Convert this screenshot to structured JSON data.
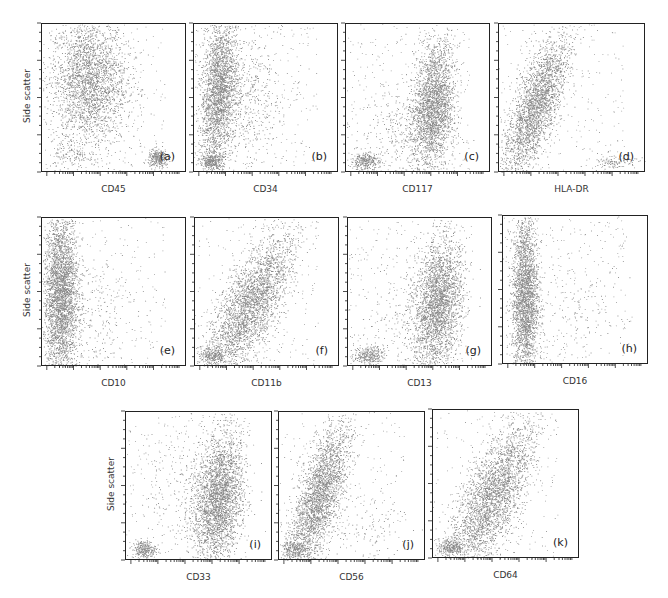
{
  "chart_data": {
    "type": "scatter",
    "ylabel": "Side scatter",
    "panels": [
      {
        "id": "a",
        "tag": "(a)",
        "xlabel": "CD45",
        "box": [
          41,
          23,
          145,
          149
        ],
        "row": 1,
        "clusters": [
          {
            "cx": 0.32,
            "cy": 0.62,
            "sx": 0.13,
            "sy": 0.22,
            "n": 2600,
            "rot": 0
          },
          {
            "cx": 0.8,
            "cy": 0.1,
            "sx": 0.035,
            "sy": 0.03,
            "n": 300,
            "rot": 0
          },
          {
            "cx": 0.2,
            "cy": 0.12,
            "sx": 0.08,
            "sy": 0.05,
            "n": 120,
            "rot": 0
          }
        ]
      },
      {
        "id": "b",
        "tag": "(b)",
        "xlabel": "CD34",
        "box": [
          193,
          23,
          145,
          149
        ],
        "row": 1,
        "clusters": [
          {
            "cx": 0.17,
            "cy": 0.55,
            "sx": 0.06,
            "sy": 0.25,
            "n": 2400,
            "rot": -0.08
          },
          {
            "cx": 0.12,
            "cy": 0.08,
            "sx": 0.04,
            "sy": 0.03,
            "n": 300,
            "rot": 0
          },
          {
            "cx": 0.35,
            "cy": 0.5,
            "sx": 0.12,
            "sy": 0.2,
            "n": 500,
            "rot": 0
          }
        ]
      },
      {
        "id": "c",
        "tag": "(c)",
        "xlabel": "CD117",
        "box": [
          345,
          23,
          145,
          149
        ],
        "row": 1,
        "clusters": [
          {
            "cx": 0.6,
            "cy": 0.45,
            "sx": 0.07,
            "sy": 0.22,
            "n": 2500,
            "rot": -0.1
          },
          {
            "cx": 0.13,
            "cy": 0.08,
            "sx": 0.05,
            "sy": 0.03,
            "n": 300,
            "rot": 0
          },
          {
            "cx": 0.4,
            "cy": 0.3,
            "sx": 0.15,
            "sy": 0.15,
            "n": 300,
            "rot": 0
          }
        ]
      },
      {
        "id": "d",
        "tag": "(d)",
        "xlabel": "HLA-DR",
        "box": [
          498,
          23,
          147,
          149
        ],
        "row": 1,
        "clusters": [
          {
            "cx": 0.25,
            "cy": 0.45,
            "sx": 0.07,
            "sy": 0.25,
            "n": 2500,
            "rot": -0.35
          },
          {
            "cx": 0.78,
            "cy": 0.08,
            "sx": 0.08,
            "sy": 0.025,
            "n": 120,
            "rot": 0
          }
        ]
      },
      {
        "id": "e",
        "tag": "(e)",
        "xlabel": "CD10",
        "box": [
          41,
          217,
          145,
          149
        ],
        "row": 2,
        "clusters": [
          {
            "cx": 0.13,
            "cy": 0.48,
            "sx": 0.06,
            "sy": 0.28,
            "n": 3200,
            "rot": 0
          },
          {
            "cx": 0.35,
            "cy": 0.4,
            "sx": 0.15,
            "sy": 0.2,
            "n": 200,
            "rot": 0
          }
        ]
      },
      {
        "id": "f",
        "tag": "(f)",
        "xlabel": "CD11b",
        "box": [
          194,
          217,
          145,
          149
        ],
        "row": 2,
        "clusters": [
          {
            "cx": 0.38,
            "cy": 0.42,
            "sx": 0.09,
            "sy": 0.26,
            "n": 2700,
            "rot": -0.5
          },
          {
            "cx": 0.12,
            "cy": 0.08,
            "sx": 0.05,
            "sy": 0.03,
            "n": 250,
            "rot": 0
          }
        ]
      },
      {
        "id": "g",
        "tag": "(g)",
        "xlabel": "CD13",
        "box": [
          347,
          217,
          145,
          149
        ],
        "row": 2,
        "clusters": [
          {
            "cx": 0.62,
            "cy": 0.42,
            "sx": 0.08,
            "sy": 0.22,
            "n": 2600,
            "rot": -0.1
          },
          {
            "cx": 0.14,
            "cy": 0.08,
            "sx": 0.05,
            "sy": 0.03,
            "n": 280,
            "rot": 0
          },
          {
            "cx": 0.45,
            "cy": 0.35,
            "sx": 0.15,
            "sy": 0.2,
            "n": 250,
            "rot": 0
          }
        ]
      },
      {
        "id": "h",
        "tag": "(h)",
        "xlabel": "CD16",
        "box": [
          502,
          215,
          146,
          149
        ],
        "row": 2,
        "clusters": [
          {
            "cx": 0.15,
            "cy": 0.45,
            "sx": 0.045,
            "sy": 0.28,
            "n": 2600,
            "rot": 0
          },
          {
            "cx": 0.5,
            "cy": 0.35,
            "sx": 0.18,
            "sy": 0.2,
            "n": 150,
            "rot": 0
          }
        ]
      },
      {
        "id": "i",
        "tag": "(i)",
        "xlabel": "CD33",
        "box": [
          125,
          411,
          147,
          149
        ],
        "row": 3,
        "clusters": [
          {
            "cx": 0.63,
            "cy": 0.42,
            "sx": 0.08,
            "sy": 0.22,
            "n": 2700,
            "rot": -0.1
          },
          {
            "cx": 0.12,
            "cy": 0.08,
            "sx": 0.04,
            "sy": 0.03,
            "n": 280,
            "rot": 0
          },
          {
            "cx": 0.45,
            "cy": 0.4,
            "sx": 0.15,
            "sy": 0.2,
            "n": 300,
            "rot": 0
          }
        ]
      },
      {
        "id": "j",
        "tag": "(j)",
        "xlabel": "CD56",
        "box": [
          278,
          411,
          147,
          149
        ],
        "row": 3,
        "clusters": [
          {
            "cx": 0.27,
            "cy": 0.42,
            "sx": 0.07,
            "sy": 0.26,
            "n": 2600,
            "rot": -0.3
          },
          {
            "cx": 0.1,
            "cy": 0.08,
            "sx": 0.05,
            "sy": 0.03,
            "n": 250,
            "rot": 0
          },
          {
            "cx": 0.6,
            "cy": 0.25,
            "sx": 0.15,
            "sy": 0.15,
            "n": 120,
            "rot": 0
          }
        ]
      },
      {
        "id": "k",
        "tag": "(k)",
        "xlabel": "CD64",
        "box": [
          432,
          409,
          147,
          149
        ],
        "row": 3,
        "clusters": [
          {
            "cx": 0.4,
            "cy": 0.42,
            "sx": 0.09,
            "sy": 0.27,
            "n": 2700,
            "rot": -0.45
          },
          {
            "cx": 0.12,
            "cy": 0.08,
            "sx": 0.05,
            "sy": 0.03,
            "n": 280,
            "rot": 0
          }
        ]
      }
    ],
    "ylabels": [
      {
        "text": "Side scatter",
        "x": 27,
        "y": 97
      },
      {
        "text": "Side scatter",
        "x": 27,
        "y": 291
      },
      {
        "text": "Side scatter",
        "x": 111,
        "y": 485
      }
    ],
    "x_scale": "log",
    "y_scale": "linear",
    "grid": false,
    "legend": null,
    "dot_color": "#2a2a2a"
  }
}
